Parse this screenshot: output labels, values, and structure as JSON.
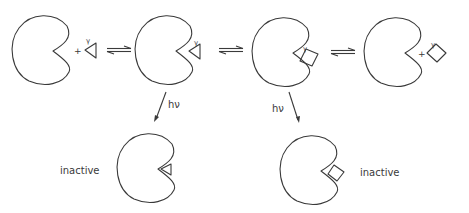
{
  "diagram": {
    "type": "photoaffinity-labeling scheme",
    "colors": {
      "line": "#3a3a3a",
      "background": "#ffffff"
    },
    "top_row": {
      "states": [
        {
          "id": "receptor-plus-triangle-ligand",
          "plus": "+",
          "ligand_shape": "triangle",
          "ligand_label": "γ"
        },
        {
          "id": "receptor-triangle-complex",
          "ligand_shape": "triangle",
          "ligand_label": "γ"
        },
        {
          "id": "receptor-square-complex",
          "ligand_shape": "square",
          "ligand_label": "γ"
        },
        {
          "id": "receptor-plus-square-ligand",
          "plus": "+",
          "ligand_shape": "square",
          "ligand_label": "γ"
        }
      ],
      "equilibria": [
        "⇌",
        "⇌",
        "⇌"
      ]
    },
    "photolysis": [
      {
        "label": "hν",
        "from": "receptor-triangle-complex",
        "to": "inactive-triangle"
      },
      {
        "label": "hν",
        "from": "receptor-square-complex",
        "to": "inactive-square"
      }
    ],
    "bottom_row": [
      {
        "id": "inactive-triangle",
        "label": "inactive"
      },
      {
        "id": "inactive-square",
        "label": "inactive"
      }
    ]
  }
}
